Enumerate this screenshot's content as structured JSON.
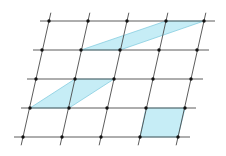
{
  "diagram": {
    "title": "",
    "type": "oblique-lattice",
    "colors": {
      "background": "#ffffff",
      "grid_line": "#4a4a4a",
      "point": "#111111",
      "fill": "#c6edf6",
      "fill_edge": "#86cde0"
    },
    "rows": [
      {
        "y": 21,
        "x": [
          49,
          88,
          127,
          166,
          204
        ],
        "line": [
          40,
          215
        ]
      },
      {
        "y": 50,
        "x": [
          42,
          81,
          120,
          159,
          197
        ],
        "line": [
          33,
          209
        ]
      },
      {
        "y": 79,
        "x": [
          36,
          75,
          114,
          153,
          191
        ],
        "line": [
          27,
          203
        ]
      },
      {
        "y": 108,
        "x": [
          30,
          69,
          107,
          146,
          185
        ],
        "line": [
          21,
          196
        ]
      },
      {
        "y": 137,
        "x": [
          23,
          62,
          101,
          140,
          178
        ],
        "line": [
          14,
          190
        ]
      }
    ],
    "shaded_regions": [
      {
        "name": "top-parallelogram",
        "points": [
          [
            81,
            50
          ],
          [
            166,
            21
          ],
          [
            204,
            21
          ],
          [
            120,
            50
          ]
        ]
      },
      {
        "name": "middle-parallelogram",
        "points": [
          [
            30,
            108
          ],
          [
            75,
            79
          ],
          [
            114,
            79
          ],
          [
            69,
            108
          ]
        ]
      },
      {
        "name": "bottom-cell",
        "points": [
          [
            146,
            108
          ],
          [
            185,
            108
          ],
          [
            178,
            137
          ],
          [
            140,
            137
          ]
        ]
      }
    ]
  }
}
